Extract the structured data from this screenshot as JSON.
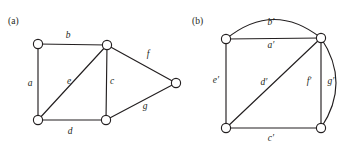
{
  "figure": {
    "panels": [
      {
        "id": "panel-a",
        "caption": "(a)",
        "caption_pos": {
          "x": 8,
          "y": 24
        },
        "vertices": [
          {
            "name": "a-top-left",
            "cx": 38,
            "cy": 44
          },
          {
            "name": "a-bottom-left",
            "cx": 38,
            "cy": 120
          },
          {
            "name": "a-top-middle",
            "cx": 107,
            "cy": 45
          },
          {
            "name": "a-bottom-middle",
            "cx": 106,
            "cy": 120
          },
          {
            "name": "a-right",
            "cx": 176,
            "cy": 83
          }
        ],
        "edges": [
          {
            "name": "edge-a",
            "label": "a",
            "from": "a-top-left",
            "to": "a-bottom-left",
            "shape": "straight",
            "label_pos": {
              "x": 30,
              "y": 86
            }
          },
          {
            "name": "edge-b",
            "label": "b",
            "from": "a-top-left",
            "to": "a-top-middle",
            "shape": "straight",
            "label_pos": {
              "x": 68,
              "y": 38
            }
          },
          {
            "name": "edge-e",
            "label": "e",
            "from": "a-bottom-left",
            "to": "a-top-middle",
            "shape": "straight",
            "label_pos": {
              "x": 69,
              "y": 84
            }
          },
          {
            "name": "edge-d",
            "label": "d",
            "from": "a-bottom-left",
            "to": "a-bottom-middle",
            "shape": "straight",
            "label_pos": {
              "x": 70,
              "y": 134
            }
          },
          {
            "name": "edge-c",
            "label": "c",
            "from": "a-top-middle",
            "to": "a-bottom-middle",
            "shape": "straight",
            "label_pos": {
              "x": 112,
              "y": 84
            }
          },
          {
            "name": "edge-f",
            "label": "f",
            "from": "a-top-middle",
            "to": "a-right",
            "shape": "straight",
            "label_pos": {
              "x": 148,
              "y": 57
            }
          },
          {
            "name": "edge-g",
            "label": "g",
            "from": "a-bottom-middle",
            "to": "a-right",
            "shape": "straight",
            "label_pos": {
              "x": 145,
              "y": 109
            }
          }
        ]
      },
      {
        "id": "panel-b",
        "caption": "(b)",
        "caption_pos": {
          "x": 192,
          "y": 24
        },
        "vertices": [
          {
            "name": "b-top-left",
            "cx": 226,
            "cy": 39
          },
          {
            "name": "b-top-right",
            "cx": 321,
            "cy": 38
          },
          {
            "name": "b-bottom-left",
            "cx": 226,
            "cy": 128
          },
          {
            "name": "b-bottom-right",
            "cx": 321,
            "cy": 128
          }
        ],
        "edges": [
          {
            "name": "edge-b-prime",
            "label": "b′",
            "from": "b-top-left",
            "to": "b-top-right",
            "shape": "arc-up",
            "bulge": 19,
            "label_pos": {
              "x": 271,
              "y": 25
            }
          },
          {
            "name": "edge-a-prime",
            "label": "a′",
            "from": "b-top-left",
            "to": "b-top-right",
            "shape": "straight",
            "label_pos": {
              "x": 271,
              "y": 48
            }
          },
          {
            "name": "edge-e-prime",
            "label": "e′",
            "from": "b-top-left",
            "to": "b-bottom-left",
            "shape": "straight",
            "label_pos": {
              "x": 216,
              "y": 83
            }
          },
          {
            "name": "edge-d-prime",
            "label": "d′",
            "from": "b-bottom-left",
            "to": "b-top-right",
            "shape": "straight",
            "label_pos": {
              "x": 264,
              "y": 85
            }
          },
          {
            "name": "edge-c-prime",
            "label": "c′",
            "from": "b-bottom-left",
            "to": "b-bottom-right",
            "shape": "straight",
            "label_pos": {
              "x": 271,
              "y": 141
            }
          },
          {
            "name": "edge-f-prime",
            "label": "f′",
            "from": "b-top-right",
            "to": "b-bottom-right",
            "shape": "straight",
            "label_pos": {
              "x": 309,
              "y": 84
            }
          },
          {
            "name": "edge-g-prime",
            "label": "g′",
            "from": "b-top-right",
            "to": "b-bottom-right",
            "shape": "arc-right",
            "bulge": 15,
            "label_pos": {
              "x": 331,
              "y": 84
            }
          }
        ]
      }
    ],
    "style": {
      "stroke_color": "#231f20",
      "background_color": "#ffffff",
      "vertex_radius": 4.6,
      "vertex_fill": "#ffffff"
    }
  }
}
